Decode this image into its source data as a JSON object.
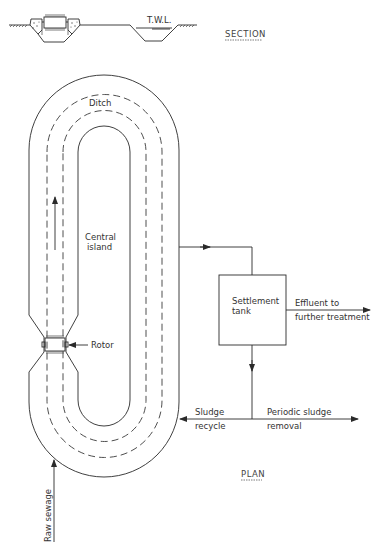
{
  "section": {
    "title": "SECTION",
    "twl_label": "T.W.L."
  },
  "plan": {
    "title": "PLAN",
    "labels": {
      "ditch": "Ditch",
      "central_island_line1": "Central",
      "central_island_line2": "island",
      "rotor": "Rotor",
      "settlement_tank_line1": "Settlement",
      "settlement_tank_line2": "tank",
      "effluent_line1": "Effluent to",
      "effluent_line2": "further treatment",
      "sludge_recycle_line1": "Sludge",
      "sludge_recycle_line2": "recycle",
      "periodic_removal_line1": "Periodic sludge",
      "periodic_removal_line2": "removal",
      "raw_sewage": "Raw sewage"
    }
  },
  "colors": {
    "line": "#2a2a2a",
    "background": "#ffffff"
  }
}
